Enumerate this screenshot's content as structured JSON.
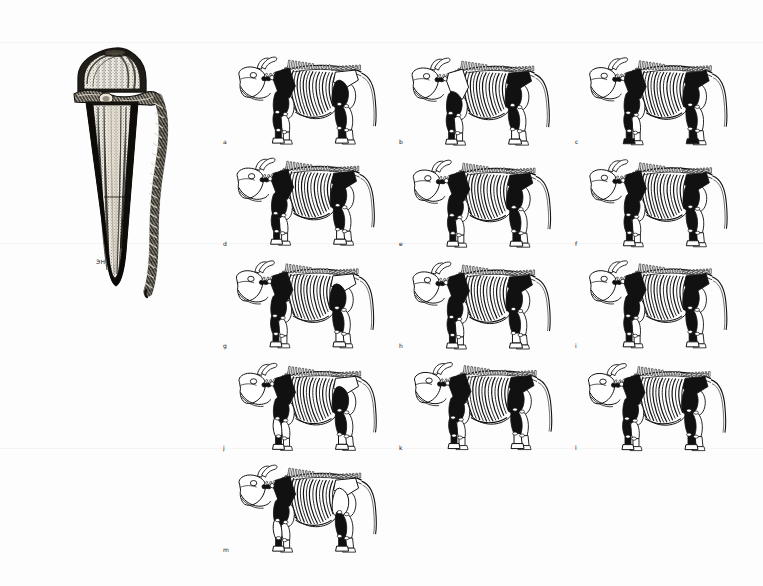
{
  "figure": {
    "type": "archaeozoological-plate",
    "background_color": "#fdfdfd",
    "ink_color": "#111111"
  },
  "artifact": {
    "name": "bone-pin-with-twisted-cord",
    "description": "Antler/bone pin with domed head and braided cord",
    "caption": "ЭН",
    "head_shape": "dome",
    "shaft_shape": "tapering-point",
    "cord": "twisted-two-ply"
  },
  "skeleton_grid": {
    "columns": 3,
    "rows": 5,
    "species": "cattle",
    "view": "lateral-left",
    "panels": [
      {
        "label": "a",
        "shaded": [
          "scapula",
          "humerus",
          "radius-ulna",
          "metacarpal",
          "femur",
          "tibia",
          "metatarsal"
        ]
      },
      {
        "label": "b",
        "shaded": [
          "humerus",
          "radius-ulna",
          "metacarpal",
          "pelvis",
          "femur",
          "tibia"
        ]
      },
      {
        "label": "c",
        "shaded": [
          "scapula",
          "humerus",
          "radius-ulna",
          "metacarpal",
          "pelvis",
          "femur",
          "tibia",
          "metatarsal",
          "phalanges"
        ]
      },
      {
        "label": "d",
        "shaded": [
          "scapula",
          "humerus",
          "radius-ulna",
          "metacarpal",
          "pelvis",
          "femur",
          "tibia"
        ]
      },
      {
        "label": "e",
        "shaded": [
          "scapula",
          "humerus",
          "radius-ulna",
          "metacarpal",
          "pelvis",
          "femur",
          "tibia",
          "metatarsal"
        ]
      },
      {
        "label": "f",
        "shaded": [
          "scapula",
          "humerus",
          "radius-ulna",
          "metacarpal",
          "pelvis",
          "femur",
          "tibia",
          "metatarsal"
        ]
      },
      {
        "label": "g",
        "shaded": [
          "scapula",
          "humerus",
          "radius-ulna",
          "metacarpal",
          "femur",
          "tibia"
        ]
      },
      {
        "label": "h",
        "shaded": [
          "scapula",
          "humerus",
          "radius-ulna",
          "metacarpal",
          "pelvis",
          "femur",
          "tibia"
        ]
      },
      {
        "label": "i",
        "shaded": [
          "scapula",
          "humerus",
          "radius-ulna",
          "metacarpal",
          "pelvis",
          "femur",
          "tibia",
          "metatarsal"
        ]
      },
      {
        "label": "j",
        "shaded": [
          "scapula",
          "humerus",
          "metacarpal",
          "femur",
          "tibia"
        ]
      },
      {
        "label": "k",
        "shaded": [
          "scapula",
          "humerus",
          "radius-ulna",
          "metacarpal",
          "pelvis",
          "femur",
          "tibia"
        ]
      },
      {
        "label": "l",
        "shaded": [
          "scapula",
          "humerus",
          "radius-ulna",
          "metacarpal",
          "pelvis",
          "femur",
          "tibia",
          "metatarsal"
        ]
      },
      {
        "label": "m",
        "shaded": [
          "scapula",
          "humerus",
          "metacarpal",
          "tibia",
          "metatarsal"
        ]
      }
    ]
  }
}
